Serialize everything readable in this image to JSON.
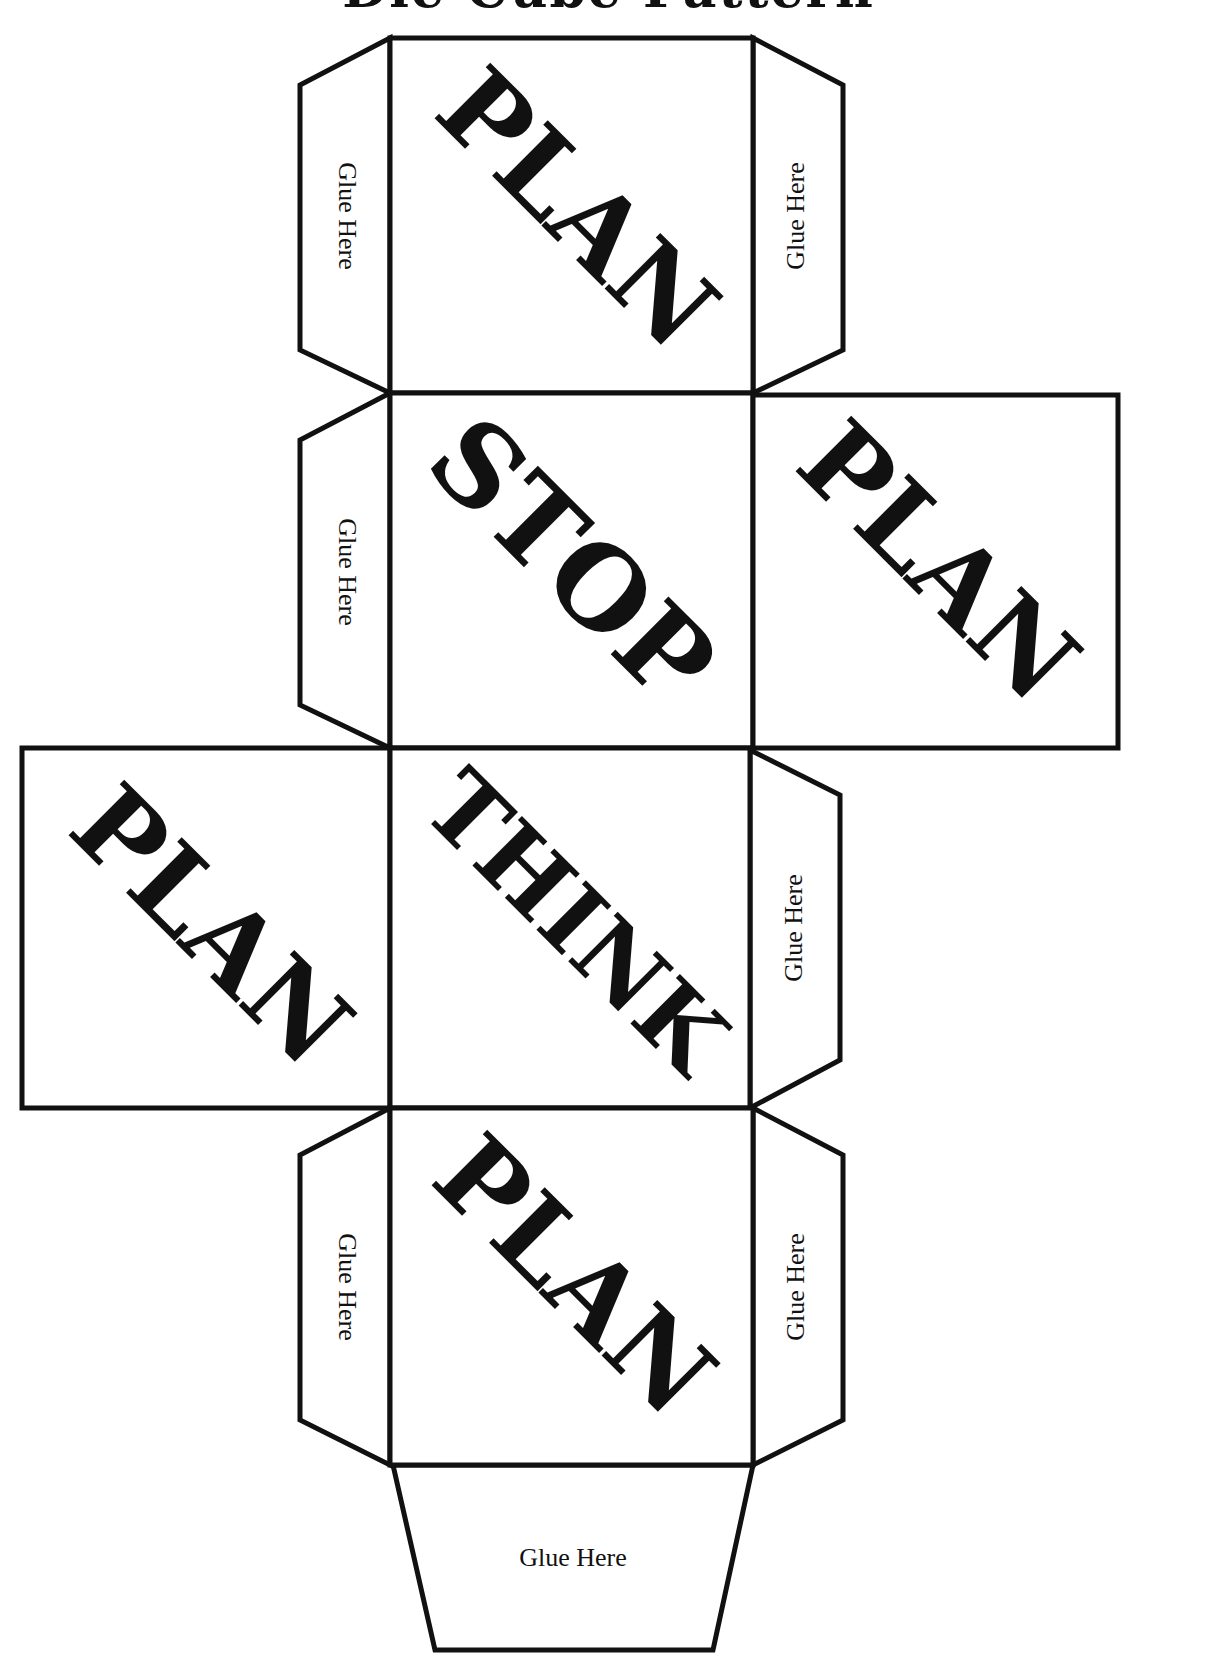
{
  "document": {
    "title": "Die Cube Pattern",
    "colors": {
      "ink": "#111111",
      "paper": "#ffffff"
    }
  },
  "faces": [
    {
      "id": "top",
      "label": "PLAN"
    },
    {
      "id": "upper-middle",
      "label": "STOP"
    },
    {
      "id": "upper-right",
      "label": "PLAN"
    },
    {
      "id": "lower-left",
      "label": "PLAN"
    },
    {
      "id": "lower-middle",
      "label": "THINK"
    },
    {
      "id": "bottom",
      "label": "PLAN"
    }
  ],
  "glue_tabs": [
    {
      "id": "top-left",
      "label": "Glue Here"
    },
    {
      "id": "top-right",
      "label": "Glue Here"
    },
    {
      "id": "upper-middle-left",
      "label": "Glue Here"
    },
    {
      "id": "lower-middle-right",
      "label": "Glue Here"
    },
    {
      "id": "bottom-left",
      "label": "Glue Here"
    },
    {
      "id": "bottom-right",
      "label": "Glue Here"
    },
    {
      "id": "bottom-base",
      "label": "Glue Here"
    }
  ]
}
